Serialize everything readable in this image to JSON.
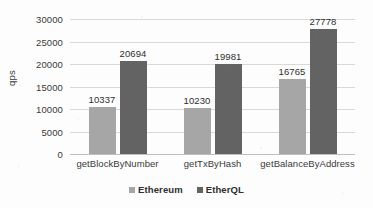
{
  "chart_data": {
    "type": "bar",
    "title": "",
    "subtitle": "",
    "xlabel": "",
    "ylabel": "qps",
    "categories": [
      "getBlockByNumber",
      "getTxByHash",
      "getBalanceByAddress"
    ],
    "series": [
      {
        "name": "Ethereum",
        "color": "#a6a6a6",
        "values": [
          10337,
          10230,
          16765
        ]
      },
      {
        "name": "EtherQL",
        "color": "#636363",
        "values": [
          20694,
          19981,
          27778
        ]
      }
    ],
    "ylim": [
      0,
      30000
    ],
    "ytick_values": [
      0,
      5000,
      10000,
      15000,
      20000,
      25000,
      30000
    ],
    "ytick_labels": [
      "0",
      "5000",
      "10000",
      "15000",
      "20000",
      "25000",
      "30000"
    ],
    "data_labels": [
      [
        "10337",
        "20694"
      ],
      [
        "10230",
        "19981"
      ],
      [
        "16765",
        "27778"
      ]
    ],
    "grid": true,
    "grid_axis": "y",
    "legend": true,
    "legend_position": "bottom",
    "bar_value_labels_shown": true
  },
  "colors": {
    "background": "#fdfdfd",
    "gridline": "#d9d9d9",
    "axis": "#bfbfbf",
    "text": "#2e2e2e",
    "series_ethereum": "#a6a6a6",
    "series_etherql": "#636363"
  }
}
